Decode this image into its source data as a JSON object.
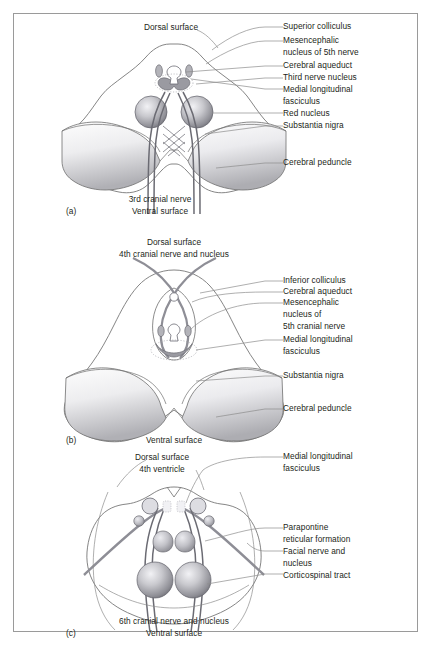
{
  "figure": {
    "border_color": "#9a9a9a",
    "background": "#ffffff",
    "ink_color": "#231f20",
    "leader_color": "#8d8d8d",
    "outline_color": "#6f6f6f",
    "nerve_fill": "#b9b9bd",
    "sphere_dark": "#6e6e74",
    "sphere_light": "#e8e8ec",
    "peduncle_light": "#fbfbfb",
    "peduncle_dark": "#b4b4b8"
  },
  "panels": [
    {
      "id": "a",
      "caption": "(a)",
      "section_name": "midbrain-superior-colliculus-level",
      "top_labels": [
        {
          "name": "dorsal-surface",
          "text": "Dorsal surface"
        }
      ],
      "bottom_labels": [
        {
          "name": "third-cranial-nerve",
          "text": "3rd cranial nerve"
        },
        {
          "name": "ventral-surface",
          "text": "Ventral surface"
        }
      ],
      "right_labels": [
        {
          "name": "superior-colliculus",
          "lines": [
            "Superior colliculus"
          ]
        },
        {
          "name": "mesencephalic-nucleus-5th-nerve",
          "lines": [
            "Mesencephalic",
            "nucleus of 5th nerve"
          ]
        },
        {
          "name": "cerebral-aqueduct",
          "lines": [
            "Cerebral aqueduct"
          ]
        },
        {
          "name": "third-nerve-nucleus",
          "lines": [
            "Third nerve nucleus"
          ]
        },
        {
          "name": "medial-longitudinal-fasciculus",
          "lines": [
            "Medial longitudinal",
            "fasciculus"
          ]
        },
        {
          "name": "red-nucleus",
          "lines": [
            "Red nucleus"
          ]
        },
        {
          "name": "substantia-nigra",
          "lines": [
            "Substantia nigra"
          ]
        },
        {
          "name": "cerebral-peduncle",
          "lines": [
            "Cerebral peduncle"
          ]
        }
      ]
    },
    {
      "id": "b",
      "caption": "(b)",
      "section_name": "midbrain-inferior-colliculus-level",
      "top_labels": [
        {
          "name": "dorsal-surface",
          "text": "Dorsal surface"
        },
        {
          "name": "fourth-cranial-nerve-and-nucleus",
          "text": "4th cranial nerve and nucleus"
        }
      ],
      "bottom_labels": [
        {
          "name": "ventral-surface",
          "text": "Ventral surface"
        }
      ],
      "right_labels": [
        {
          "name": "inferior-colliculus",
          "lines": [
            "Inferior colliculus"
          ]
        },
        {
          "name": "cerebral-aqueduct",
          "lines": [
            "Cerebral aqueduct"
          ]
        },
        {
          "name": "mesencephalic-nucleus-5th-cranial-nerve",
          "lines": [
            "Mesencephalic",
            "nucleus of",
            "5th cranial nerve"
          ]
        },
        {
          "name": "medial-longitudinal-fasciculus",
          "lines": [
            "Medial longitudinal",
            "fasciculus"
          ]
        },
        {
          "name": "substantia-nigra",
          "lines": [
            "Substantia nigra"
          ]
        },
        {
          "name": "cerebral-peduncle",
          "lines": [
            "Cerebral peduncle"
          ]
        }
      ]
    },
    {
      "id": "c",
      "caption": "(c)",
      "section_name": "pons-level",
      "top_labels": [
        {
          "name": "dorsal-surface",
          "text": "Dorsal surface"
        },
        {
          "name": "fourth-ventricle",
          "text": "4th ventricle"
        }
      ],
      "bottom_labels": [
        {
          "name": "sixth-cranial-nerve-and-nucleus",
          "text": "6th cranial nerve and nucleus"
        },
        {
          "name": "ventral-surface",
          "text": "Ventral surface"
        }
      ],
      "right_labels": [
        {
          "name": "medial-longitudinal-fasciculus",
          "lines": [
            "Medial longitudinal",
            "fasciculus"
          ]
        },
        {
          "name": "parapontine-reticular-formation",
          "lines": [
            "Parapontine",
            "reticular formation"
          ]
        },
        {
          "name": "facial-nerve-and-nucleus",
          "lines": [
            "Facial nerve and",
            "nucleus"
          ]
        },
        {
          "name": "corticospinal-tract",
          "lines": [
            "Corticospinal tract"
          ]
        }
      ]
    }
  ]
}
